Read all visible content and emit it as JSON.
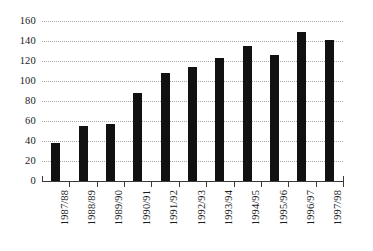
{
  "chart_data": {
    "type": "bar",
    "title": "",
    "subtitle": "",
    "xlabel": "",
    "ylabel": "",
    "categories": [
      "1987/88",
      "1988/89",
      "1989/90",
      "1990/91",
      "1991/92",
      "1992/93",
      "1993/94",
      "1994/95",
      "1995/96",
      "1996/97",
      "1997/98"
    ],
    "values": [
      38,
      55,
      57,
      88,
      108,
      114,
      123,
      135,
      126,
      149,
      141
    ],
    "ylim": [
      0,
      160
    ],
    "ytick_values": [
      0,
      20,
      40,
      60,
      80,
      100,
      120,
      140,
      160
    ],
    "ytick_labels": [
      "0",
      "20",
      "40",
      "60",
      "80",
      "100",
      "120",
      "140",
      "160"
    ],
    "grid": true,
    "grid_axis": "y",
    "grid_style": "dotted",
    "legend": false,
    "legend_position": "none",
    "bar_color": "#111111",
    "grid_color": "#9a9a9a",
    "axis_color": "#3a3a3a",
    "text_color": "#1b1b1b",
    "background_color": "#ffffff",
    "xtick_label_rotation": 90
  }
}
